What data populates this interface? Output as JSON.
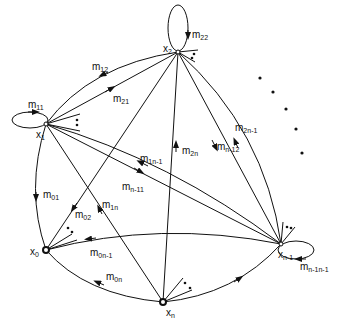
{
  "diagram": {
    "type": "directed-graph",
    "nodes": [
      {
        "id": "x2",
        "base": "x",
        "sub": "2",
        "x": 178,
        "y": 52
      },
      {
        "id": "x1",
        "base": "x",
        "sub": "1",
        "x": 46,
        "y": 124
      },
      {
        "id": "x0",
        "base": "x",
        "sub": "0",
        "x": 46,
        "y": 250
      },
      {
        "id": "xn",
        "base": "x",
        "sub": "n",
        "x": 163,
        "y": 302
      },
      {
        "id": "xn-1",
        "base": "x",
        "sub": "n-1",
        "x": 281,
        "y": 244
      }
    ],
    "edges": [
      {
        "label": "m",
        "sub": "22",
        "from": "x2",
        "to": "x2",
        "self_loop": true
      },
      {
        "label": "m",
        "sub": "11",
        "from": "x1",
        "to": "x1",
        "self_loop": true
      },
      {
        "label": "m",
        "sub": "n-1n-1",
        "from": "xn-1",
        "to": "xn-1",
        "self_loop": true
      },
      {
        "label": "m",
        "sub": "12",
        "from": "x2",
        "to": "x1"
      },
      {
        "label": "m",
        "sub": "21",
        "from": "x1",
        "to": "x2"
      },
      {
        "label": "m",
        "sub": "01",
        "from": "x1",
        "to": "x0"
      },
      {
        "label": "m",
        "sub": "02",
        "from": "x2",
        "to": "x0"
      },
      {
        "label": "m",
        "sub": "1n",
        "from": "xn",
        "to": "x1"
      },
      {
        "label": "m",
        "sub": "2n",
        "from": "xn",
        "to": "x2"
      },
      {
        "label": "m",
        "sub": "n-12",
        "from": "x2",
        "to": "xn-1"
      },
      {
        "label": "m",
        "sub": "2n-1",
        "from": "xn-1",
        "to": "x2"
      },
      {
        "label": "m",
        "sub": "1n-1",
        "from": "xn-1",
        "to": "x1"
      },
      {
        "label": "m",
        "sub": "n-11",
        "from": "x1",
        "to": "xn-1"
      },
      {
        "label": "m",
        "sub": "0n-1",
        "from": "xn-1",
        "to": "x0"
      },
      {
        "label": "m",
        "sub": "0n",
        "from": "xn",
        "to": "x0"
      },
      {
        "label": "",
        "sub": "",
        "from": "xn",
        "to": "xn-1"
      }
    ],
    "ellipsis_dots": 5
  }
}
